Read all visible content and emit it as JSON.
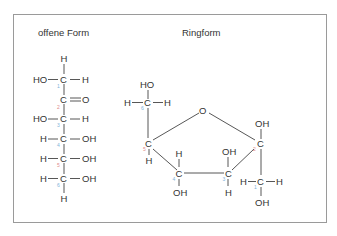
{
  "figure": {
    "open_form_title": "offene Form",
    "ring_form_title": "Ringform",
    "colors": {
      "num_blue": "#7fb3d8",
      "num_red": "#e08c8c",
      "text": "#333333",
      "frame": "#9a9a9a"
    }
  },
  "open_form": {
    "top_h": "H",
    "c1": {
      "left": "HO",
      "atom": "C",
      "right": "H",
      "num": "1"
    },
    "c2": {
      "atom": "C",
      "right": "O",
      "num": "2"
    },
    "c3": {
      "left": "HO",
      "atom": "C",
      "right": "H",
      "num": "3"
    },
    "c4": {
      "left": "H",
      "atom": "C",
      "right": "OH",
      "num": "4"
    },
    "c5": {
      "left": "H",
      "atom": "C",
      "right": "OH",
      "num": "5"
    },
    "c6": {
      "left": "H",
      "atom": "C",
      "right": "OH",
      "num": "6"
    },
    "bottom_h": "H"
  },
  "ring_form": {
    "c6": {
      "top": "HO",
      "left": "H",
      "atom": "C",
      "right": "H",
      "num": "6"
    },
    "ring_o": "O",
    "c5": {
      "atom": "C",
      "bottom": "H",
      "num": "5"
    },
    "c4": {
      "top": "H",
      "atom": "C",
      "bottom": "OH",
      "num": "4"
    },
    "c3": {
      "top": "OH",
      "atom": "C",
      "bottom": "H",
      "num": "3"
    },
    "c2": {
      "top": "OH",
      "atom": "C",
      "num": "2"
    },
    "c1": {
      "left": "H",
      "atom": "C",
      "right": "H",
      "bottom": "OH",
      "num": "1"
    }
  }
}
